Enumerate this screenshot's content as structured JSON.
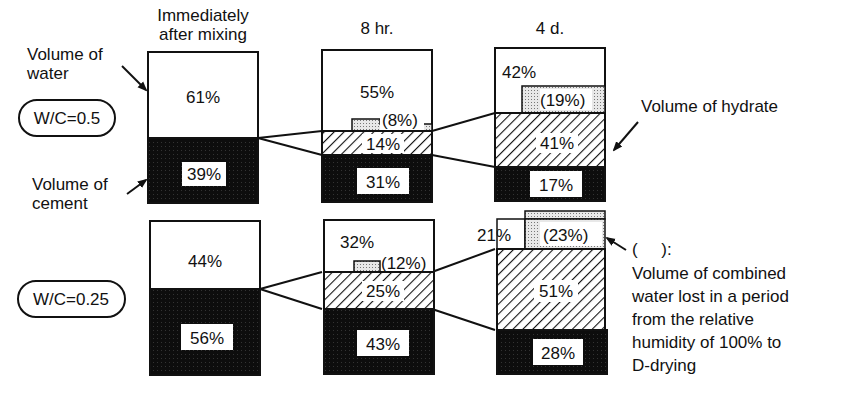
{
  "columns": [
    {
      "label_line1": "Immediately",
      "label_line2": "after mixing"
    },
    {
      "label": "8 hr."
    },
    {
      "label": "4 d."
    }
  ],
  "rows": [
    {
      "label": "W/C=0.5",
      "bars": [
        {
          "water": "61%",
          "cement": "39%"
        },
        {
          "water": "55%",
          "lost": "(8%)",
          "hydrate": "14%",
          "cement": "31%"
        },
        {
          "water": "42%",
          "lost": "(19%)",
          "hydrate": "41%",
          "cement": "17%"
        }
      ]
    },
    {
      "label": "W/C=0.25",
      "bars": [
        {
          "water": "44%",
          "cement": "56%"
        },
        {
          "water": "32%",
          "lost": "(12%)",
          "hydrate": "25%",
          "cement": "43%"
        },
        {
          "water": "21%",
          "lost": "(23%)",
          "hydrate": "51%",
          "cement": "28%"
        }
      ]
    }
  ],
  "annotations": {
    "volume_of_water_1": "Volume of",
    "volume_of_water_2": "water",
    "volume_of_cement_1": "Volume of",
    "volume_of_cement_2": "cement",
    "volume_of_hydrate": "Volume of hydrate",
    "paren_symbol": "(     ):",
    "combined_water_1": "Volume of combined",
    "combined_water_2": "water lost in a period",
    "combined_water_3": "from the relative",
    "combined_water_4": "humidity of 100% to",
    "combined_water_5": "D-drying"
  }
}
